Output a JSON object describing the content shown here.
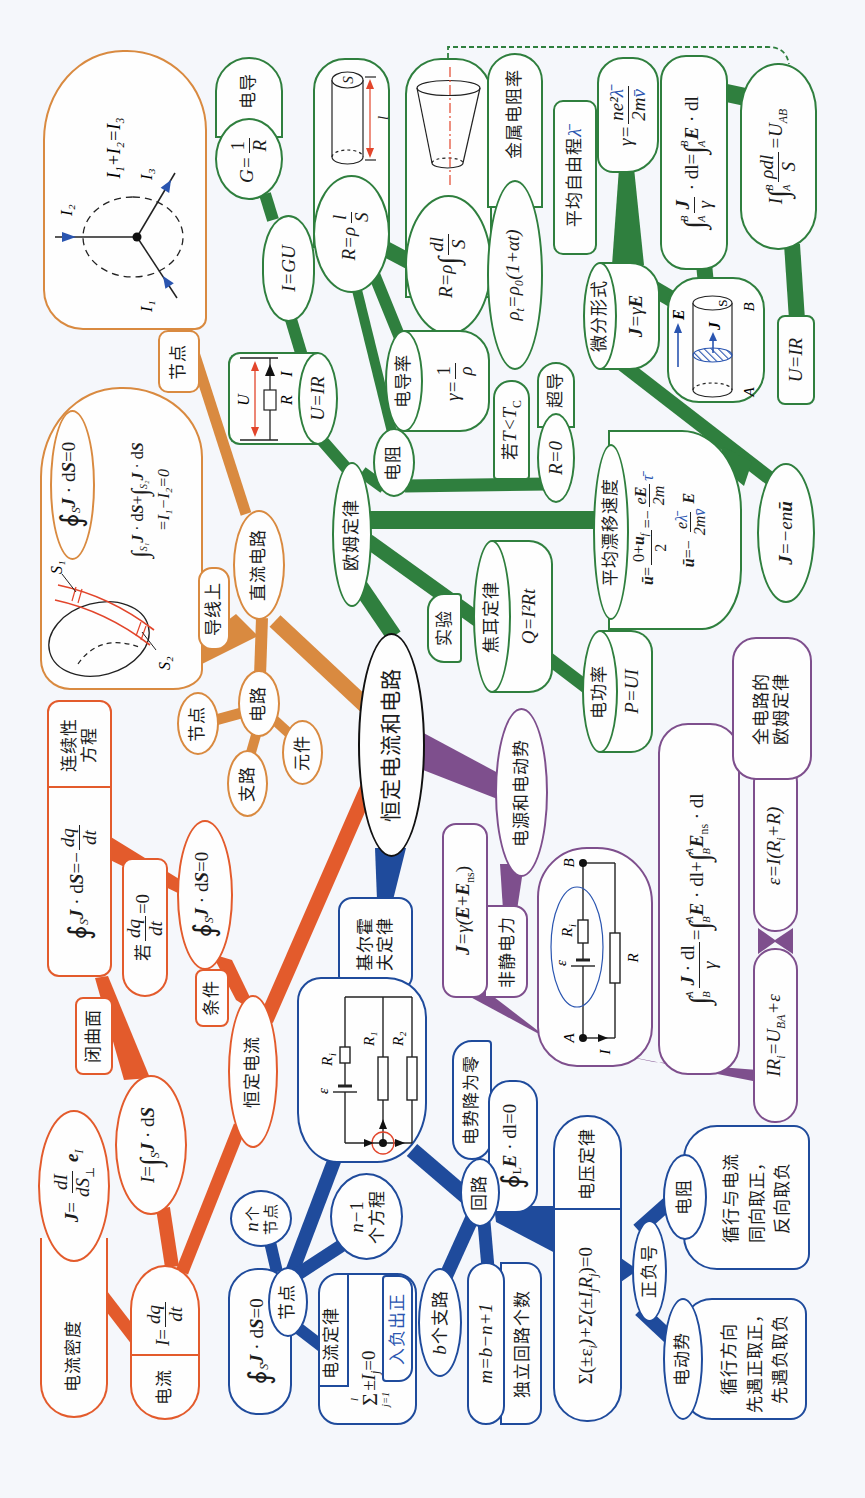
{
  "title": "恒定电流和电路",
  "colors": {
    "background": "#f5f7fb",
    "center_border": "#111111",
    "steady_current": "#e35b2c",
    "dc_circuit": "#d98a40",
    "ohm_law": "#2f7f3e",
    "emf": "#7e4f8d",
    "kirchhoff": "#1f4b9c",
    "annotation_red": "#e2452b",
    "annotation_blue": "#2a55b0"
  },
  "center": {
    "label": "恒定电流和电路"
  },
  "steady_current": {
    "label": "恒定电流",
    "tag_condition": "条件",
    "tag_closed_surface": "闭曲面",
    "current": {
      "label": "电流",
      "lhs": "I",
      "eq": "=",
      "num": "dq",
      "den": "dt"
    },
    "current_density": {
      "label": "电流密度",
      "lhs": "J",
      "eq": "=",
      "num": "dI",
      "den": "dS",
      "den_sub": "⊥",
      "unit": "e",
      "unit_sub": "I"
    },
    "flux": {
      "lhs": "I",
      "eq": "=",
      "int": "∫",
      "int_sub": "S",
      "v1": "J",
      "op": " · d",
      "v2": "S"
    },
    "continuity": {
      "label_l1": "连续性",
      "label_l2": "方程",
      "oint": "∮",
      "oint_sub": "S",
      "v1": "J",
      "op": " · d",
      "v2": "S",
      "eq": "=−",
      "num": "dq",
      "den": "dt"
    },
    "if_steady": {
      "prefix": "若",
      "num": "dq",
      "den": "dt",
      "tail": "=0"
    },
    "steady_condition": {
      "oint": "∮",
      "oint_sub": "S",
      "v1": "J",
      "op": " · d",
      "v2": "S",
      "tail": "=0"
    }
  },
  "dc_circuit": {
    "label": "直流电路",
    "tag_on_wire": "导线上",
    "tag_node": "节点",
    "circuit": {
      "label": "电路",
      "node": "节点",
      "branch": "支路",
      "element": "元件"
    },
    "surface": {
      "closed": {
        "oint": "∮",
        "oint_sub": "S",
        "v1": "J",
        "op": " · d",
        "v2": "S",
        "tail": "=0"
      },
      "split": {
        "int1": "∫",
        "sub1": "S₁",
        "v1": "J",
        "op1": " · d",
        "v2": "S",
        "plus": "+",
        "int2": "∫",
        "sub2": "S₂",
        "v3": "J",
        "op2": " · d",
        "v4": "S",
        "line2": "=I₁−I₂=0"
      },
      "label_s1": "S₁",
      "label_s2": "S₂"
    },
    "junction": {
      "equation": "I₁+I₂=I₃",
      "i1": "I₁",
      "i2": "I₂",
      "i3": "I₃"
    }
  },
  "ohm_law": {
    "label": "欧姆定律",
    "uir": {
      "formula": "U=IR",
      "u": "U",
      "r": "R",
      "i": "I"
    },
    "igu": {
      "formula": "I=GU"
    },
    "conductance": {
      "label": "电导",
      "lhs": "G=",
      "num": "1",
      "den": "R"
    },
    "resistance": {
      "label": "电阻"
    },
    "r_uniform": {
      "lhs": "R=ρ",
      "num": "l",
      "den": "S",
      "fig_s": "S",
      "fig_l": "l"
    },
    "r_integral": {
      "lhs": "R=ρ",
      "int": "∫",
      "num": "dl",
      "den": "S"
    },
    "resistivity_temp": {
      "rho": "ρ",
      "rho_sub": "t",
      "rest": "=ρ₀(1+αt)",
      "label": "金属电阻率"
    },
    "conductivity": {
      "label": "电导率",
      "lhs": "γ=",
      "num": "1",
      "den": "ρ"
    },
    "superconduct": {
      "cond": "若",
      "cond_formula": "T<T",
      "cond_sub": "C",
      "r0": "R=0",
      "label": "超导"
    },
    "differential": {
      "label": "微分形式",
      "v1": "J",
      "eq": "=γ",
      "v2": "E"
    },
    "mean_free_path": {
      "label": "平均自由程",
      "symbol": "λ̄"
    },
    "gamma": {
      "lhs": "γ=",
      "num_pre": "ne²",
      "num_sym": "λ̄",
      "den_pre": "2m",
      "den_sym": "v̄"
    },
    "cylinder": {
      "e": "E",
      "j": "J",
      "s": "S",
      "a": "A",
      "b": "B"
    },
    "line_integral": {
      "int1": "∫",
      "sup1": "B",
      "sub1": "A",
      "num": "J",
      "den": "γ",
      "op1": " · dl=",
      "int2": "∫",
      "sup2": "B",
      "sub2": "A",
      "v": "E",
      "op2": " · dl"
    },
    "potential": {
      "lhs": "I",
      "int": "∫",
      "sup": "B",
      "sub": "A",
      "num": "ρdl",
      "den": "S",
      "rhs": "=U",
      "rhs_sub": "AB"
    },
    "uir_small": {
      "formula": "U=IR"
    },
    "drift": {
      "label": "平均漂移速度",
      "l1": {
        "lhs": "ū",
        "eq1": "=",
        "num_pre": "0+",
        "num_v": "u",
        "num_sub": "f",
        "den": "2",
        "eq2": "=−",
        "num2_pre": "e",
        "num2_v": "E",
        "den2": "2m",
        "tau": "τ̄"
      },
      "l2": {
        "lhs": "ū",
        "eq1": "=−",
        "num_pre": "e",
        "num_sym": "λ̄",
        "den_pre": "2m",
        "den_sym": "v̄",
        "v": "E"
      }
    },
    "current_density_drift": {
      "v": "J",
      "rest": "=−en",
      "u": "ū"
    },
    "joule": {
      "label": "焦耳定律",
      "formula": "Q=I²Rt",
      "tag": "实验"
    },
    "power": {
      "label": "电功率",
      "formula": "P=UI"
    }
  },
  "emf": {
    "label": "电源和电动势",
    "nonelectrostatic": {
      "label": "非静电力",
      "v1": "J",
      "eq": "=γ(",
      "v2": "E",
      "plus": "+",
      "v3": "E",
      "sub": "ns",
      "close": ")"
    },
    "circuit": {
      "a": "A",
      "b": "B",
      "epsilon": "ε",
      "ri": "R",
      "ri_sub": "i",
      "r": "R",
      "i": "I"
    },
    "loop_integral": {
      "int1": "∫",
      "sup1": "A",
      "sub1": "B",
      "num_v": "J",
      "num_rest": " · dl",
      "den": "γ",
      "eq": "=",
      "int2": "∫",
      "sup2": "A",
      "sub2": "B",
      "v1": "E",
      "op1": " · dl+",
      "int3": "∫",
      "sup3": "A",
      "sub3": "B",
      "v2": "E",
      "v2_sub": "ns",
      "op2": " · dl"
    },
    "ir_eq": {
      "lhs": "IR",
      "lhs_sub": "i",
      "eq": "=U",
      "u_sub": "BA",
      "tail": "+ε"
    },
    "emf_eq": {
      "lhs": "ε=I(R",
      "sub": "i",
      "tail": "+R)"
    },
    "full_ohm": {
      "l1": "全电路的",
      "l2": "欧姆定律"
    }
  },
  "kirchhoff": {
    "label_l1": "基尔霍",
    "label_l2": "夫定律",
    "circuit": {
      "epsilon": "ε",
      "ri": "R",
      "ri_sub": "i",
      "r1": "R₁",
      "r2": "R₂"
    },
    "node": {
      "label": "节点",
      "count_var": "n",
      "count_l1": "个",
      "count_l2": "节点",
      "eq_var": "n",
      "eq_rest": "−1",
      "eq_label": "个方程"
    },
    "node_flux": {
      "oint": "∮",
      "oint_sub": "S",
      "v1": "J",
      "op": " · d",
      "v2": "S",
      "tail": "=0"
    },
    "current_law": {
      "label": "电流定律",
      "sum": "Σ",
      "sum_sup": "l",
      "sum_sub": "j=1",
      "pm": "±I",
      "pm_sub": "j",
      "tail": "=0",
      "rule": "入负出正"
    },
    "loop": {
      "label": "回路",
      "zero_drop": "电势降为零",
      "oint": "∮",
      "oint_sub": "L",
      "v": "E",
      "tail": " · dl=0"
    },
    "branches": {
      "var": "b",
      "label": "个支路"
    },
    "independent": {
      "formula": "m=b−n+1",
      "label": "独立回路个数"
    },
    "voltage_law": {
      "pre": "Σ(±ε",
      "eps_sub": "i",
      "mid": ")+Σ(±I",
      "i_sub": "j",
      "r": "R",
      "r_sub": "j",
      "tail": ")=0",
      "label": "电压定律"
    },
    "sign": {
      "label": "正负号",
      "resistor": {
        "label": "电阻",
        "l1": "循行与电流",
        "l2": "同向取正，",
        "l3": "反向取负"
      },
      "emf": {
        "label": "电动势",
        "l1": "循行方向",
        "l2": "先遇正取正，",
        "l3": "先遇负取负"
      }
    }
  }
}
